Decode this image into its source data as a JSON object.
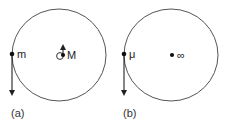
{
  "panels": [
    {
      "id": "a",
      "caption": "(a)",
      "orbiting_body_label": "m",
      "central_body_label": "M",
      "central_body_has_small_orbit": true,
      "central_body_velocity": "up",
      "orbiting_body_velocity": "down"
    },
    {
      "id": "b",
      "caption": "(b)",
      "orbiting_body_label": "μ",
      "central_body_label": "∞",
      "central_body_has_small_orbit": false,
      "orbiting_body_velocity": "down"
    }
  ],
  "colors": {
    "orbit_stroke": "#555555",
    "ink": "#222222",
    "background": "#ffffff"
  }
}
